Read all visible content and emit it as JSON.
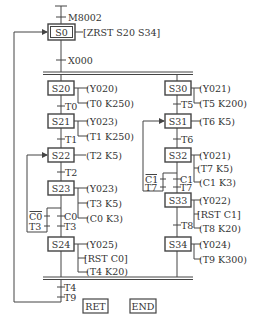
{
  "diagram": {
    "type": "sequential-function-chart",
    "initial_condition": "M8002",
    "initial_step": {
      "label": "S0",
      "action": "[ZRST S20 S34]"
    },
    "start_transition": "X000",
    "left_branch": {
      "steps": [
        {
          "label": "S20",
          "actions": [
            "(Y020)",
            "(T0 K250)"
          ]
        },
        {
          "label": "S21",
          "actions": [
            "(Y023)",
            "(T1 K250)"
          ]
        },
        {
          "label": "S22",
          "actions": [
            "(T2 K5)"
          ]
        },
        {
          "label": "S23",
          "actions": [
            "(Y023)",
            "(T3 K5)",
            "(C0 K3)"
          ]
        },
        {
          "label": "S24",
          "actions": [
            "(Y025)",
            "[RST C0]",
            "(T4 K20)"
          ]
        }
      ],
      "transitions": [
        "T0",
        "T1",
        "T2"
      ],
      "loop_contacts": {
        "top": "C0",
        "top_negated": true,
        "bottom": "T3"
      },
      "forward_contacts": {
        "top": "C0",
        "bottom": "T3"
      }
    },
    "right_branch": {
      "steps": [
        {
          "label": "S30",
          "actions": [
            "(Y021)",
            "(T5 K200)"
          ]
        },
        {
          "label": "S31",
          "actions": [
            "(T6 K5)"
          ]
        },
        {
          "label": "S32",
          "actions": [
            "(Y021)",
            "(T7 K5)",
            "(C1 K3)"
          ]
        },
        {
          "label": "S33",
          "actions": [
            "(Y022)",
            "[RST C1]",
            "(T8 K20)"
          ]
        },
        {
          "label": "S34",
          "actions": [
            "(Y024)",
            "(T9 K300)"
          ]
        }
      ],
      "transitions": [
        "T5",
        "T6",
        "T8"
      ],
      "loop_contacts": {
        "top": "C1",
        "top_negated": true,
        "bottom": "T7"
      },
      "forward_contacts": {
        "top": "C1",
        "bottom": "T7"
      }
    },
    "merge_transitions": [
      "T4",
      "T9"
    ],
    "end_blocks": [
      "RET",
      "END"
    ]
  }
}
